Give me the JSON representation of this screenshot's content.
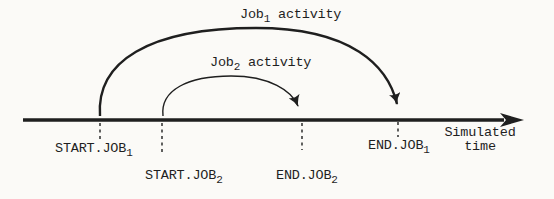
{
  "figure": {
    "background": "#fbfaf7",
    "ink": "#1f1f1f"
  },
  "arcs": [
    {
      "id": "job1",
      "label_pre": "Job",
      "label_sub": "1",
      "label_post": " activity"
    },
    {
      "id": "job2",
      "label_pre": "Job",
      "label_sub": "2",
      "label_post": " activity"
    }
  ],
  "events": [
    {
      "id": "start-job1",
      "label_pre": "START.JOB",
      "label_sub": "1"
    },
    {
      "id": "start-job2",
      "label_pre": "START.JOB",
      "label_sub": "2"
    },
    {
      "id": "end-job2",
      "label_pre": "END.JOB",
      "label_sub": "2"
    },
    {
      "id": "end-job1",
      "label_pre": "END.JOB",
      "label_sub": "1"
    }
  ],
  "axis": {
    "label_line1": "Simulated",
    "label_line2": "time"
  }
}
